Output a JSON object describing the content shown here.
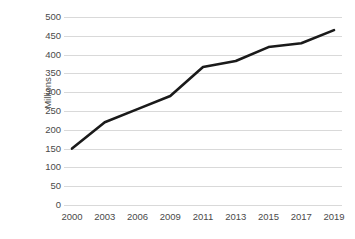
{
  "chart_data": {
    "type": "line",
    "title": "",
    "subtitle": "",
    "xlabel": "",
    "ylabel": "Millions",
    "x": [
      2000,
      2003,
      2006,
      2009,
      2011,
      2013,
      2015,
      2017,
      2019
    ],
    "categories": [
      "2000",
      "2003",
      "2006",
      "2009",
      "2011",
      "2013",
      "2015",
      "2017",
      "2019"
    ],
    "series": [
      {
        "name": "",
        "values": [
          150,
          220,
          255,
          290,
          367,
          383,
          420,
          430,
          465
        ]
      }
    ],
    "ylim": [
      0,
      500
    ],
    "yticks": [
      0,
      50,
      100,
      150,
      200,
      250,
      300,
      350,
      400,
      450,
      500
    ],
    "ytick_labels": [
      "0",
      "50",
      "100",
      "150",
      "200",
      "250",
      "300",
      "350",
      "400",
      "450",
      "500"
    ],
    "xtick_labels": [
      "2000",
      "2003",
      "2006",
      "2009",
      "2011",
      "2013",
      "2015",
      "2017",
      "2019"
    ],
    "grid": true,
    "grid_axis": "y",
    "legend": false,
    "legend_position": "none",
    "annotations": []
  },
  "style": {
    "background_color": "#ffffff",
    "line_color": "#1a1a1a",
    "grid_color": "#d9d9d9",
    "tick_label_color": "#4a4a4a",
    "axis_title_color": "#4a4a4a",
    "line_width": 2.6
  }
}
